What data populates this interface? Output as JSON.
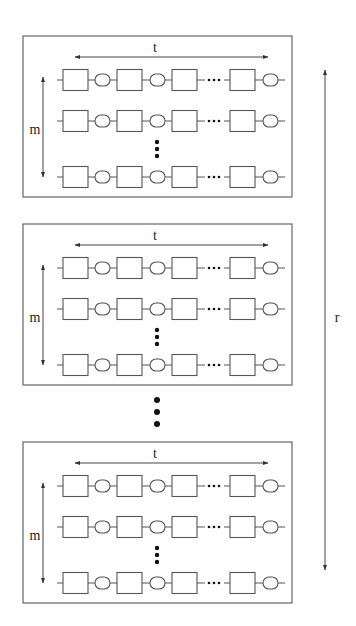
{
  "diagram": {
    "type": "replicated-chains",
    "panel_count_shown": 3,
    "panels": [
      {
        "width_label": "t",
        "height_label": "m",
        "rows_shown": 3,
        "row_ellipsis": "vertical-dots",
        "chain": [
          "box",
          "oval",
          "box",
          "oval",
          "box",
          "dots",
          "box",
          "oval"
        ]
      },
      {
        "width_label": "t",
        "height_label": "m",
        "rows_shown": 3,
        "row_ellipsis": "vertical-dots",
        "chain": [
          "box",
          "oval",
          "box",
          "oval",
          "box",
          "dots",
          "box",
          "oval"
        ]
      },
      {
        "width_label": "t",
        "height_label": "m",
        "rows_shown": 3,
        "row_ellipsis": "vertical-dots",
        "chain": [
          "box",
          "oval",
          "box",
          "oval",
          "box",
          "dots",
          "box",
          "oval"
        ]
      }
    ],
    "panel_ellipsis": "vertical-dots",
    "replication_label": "r",
    "labels": {
      "t": "t",
      "m": "m",
      "r": "r"
    }
  },
  "layout": {
    "panels_y": [
      [
        36,
        197
      ],
      [
        224,
        385
      ],
      [
        442,
        603
      ]
    ],
    "panel_x": [
      23,
      292
    ]
  }
}
